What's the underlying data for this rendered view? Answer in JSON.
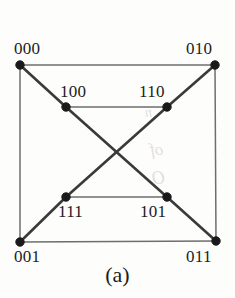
{
  "figure": {
    "caption": "(a)",
    "caption_position": {
      "top": 262
    },
    "background_color": "#fdfdfb",
    "edge_color_outer": "#6e6e6e",
    "edge_color_diagonal": "#3a3a3a",
    "node_color": "#1a1a1a",
    "label_color": "#1c1c1c"
  },
  "ghost_marks": [
    {
      "name": "ghost-fragment-1",
      "text": "of"
    },
    {
      "name": "ghost-fragment-2",
      "text": "O"
    },
    {
      "name": "ghost-fragment-3",
      "text": "n"
    }
  ],
  "chart_data": {
    "type": "diagram",
    "title": "(a)",
    "nodes": [
      {
        "id": "000",
        "label": "000",
        "x": 20,
        "y": 65,
        "label_x": 14,
        "label_y": 40,
        "label_anchor": "top-left"
      },
      {
        "id": "010",
        "label": "010",
        "x": 215,
        "y": 65,
        "label_x": 186,
        "label_y": 40,
        "label_anchor": "top-right"
      },
      {
        "id": "100",
        "label": "100",
        "x": 66,
        "y": 107,
        "label_x": 60,
        "label_y": 83,
        "label_anchor": "top-left"
      },
      {
        "id": "110",
        "label": "110",
        "x": 167,
        "y": 107,
        "label_x": 139,
        "label_y": 83,
        "label_anchor": "top-right"
      },
      {
        "id": "111",
        "label": "111",
        "x": 66,
        "y": 197,
        "label_x": 58,
        "label_y": 203,
        "label_anchor": "bottom-left"
      },
      {
        "id": "101",
        "label": "101",
        "x": 167,
        "y": 197,
        "label_x": 140,
        "label_y": 203,
        "label_anchor": "bottom-right"
      },
      {
        "id": "001",
        "label": "001",
        "x": 20,
        "y": 242,
        "label_x": 14,
        "label_y": 248,
        "label_anchor": "bottom-left"
      },
      {
        "id": "011",
        "label": "011",
        "x": 216,
        "y": 241,
        "label_x": 186,
        "label_y": 248,
        "label_anchor": "bottom-right"
      }
    ],
    "edges": [
      {
        "from": "000",
        "to": "010",
        "style": "thin",
        "kind": "outer-top"
      },
      {
        "from": "010",
        "to": "011",
        "style": "thin",
        "kind": "outer-right"
      },
      {
        "from": "011",
        "to": "001",
        "style": "thin",
        "kind": "outer-bottom"
      },
      {
        "from": "001",
        "to": "000",
        "style": "thin",
        "kind": "outer-left"
      },
      {
        "from": "100",
        "to": "110",
        "style": "thin",
        "kind": "inner-top"
      },
      {
        "from": "111",
        "to": "101",
        "style": "thin",
        "kind": "inner-bottom"
      },
      {
        "from": "000",
        "to": "100",
        "style": "thick",
        "kind": "corner-to-inner"
      },
      {
        "from": "010",
        "to": "110",
        "style": "thick",
        "kind": "corner-to-inner"
      },
      {
        "from": "001",
        "to": "111",
        "style": "thick",
        "kind": "corner-to-inner"
      },
      {
        "from": "011",
        "to": "101",
        "style": "thick",
        "kind": "corner-to-inner"
      },
      {
        "from": "100",
        "to": "101",
        "style": "thick",
        "kind": "crossing-diagonal"
      },
      {
        "from": "110",
        "to": "111",
        "style": "thick",
        "kind": "crossing-diagonal"
      }
    ],
    "node_radius": 4.2,
    "grid": false,
    "legend": null
  }
}
